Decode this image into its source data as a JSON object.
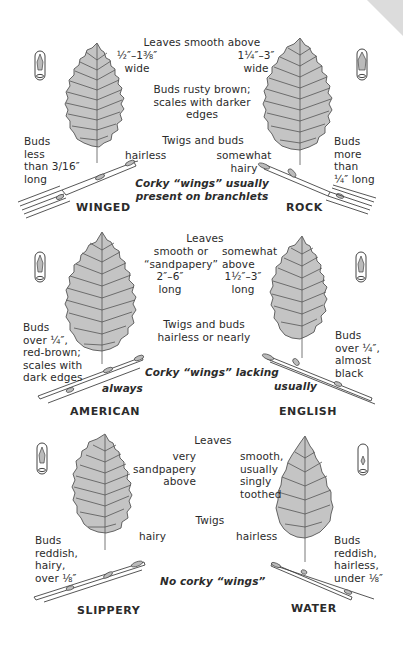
{
  "page": {
    "background": "#ffffff",
    "leaf_color": "#c4c4c4",
    "ink_color": "#2b2b2b"
  },
  "sections": [
    {
      "id": "winged-rock",
      "species": [
        {
          "name": "WINGED",
          "leaf_width": "½″–1⅜″\nwide",
          "buds": "Buds\nless\nthan 3/16″\nlong",
          "twig": "hairless"
        },
        {
          "name": "ROCK",
          "leaf_width": "1¼″–3″\nwide",
          "buds": "Buds\nmore\nthan\n¼″ long",
          "twig": "somewhat\nhairy"
        }
      ],
      "leaves_heading": "Leaves smooth above",
      "center_buds": "Buds rusty brown;\nscales with darker\nedges",
      "twigs_heading": "Twigs and buds",
      "corky": "Corky “wings” usually\npresent on branchlets"
    },
    {
      "id": "american-english",
      "species": [
        {
          "name": "AMERICAN",
          "leaf_surface": "smooth or\n“sandpapery”",
          "leaf_length": "2″–6″\nlong",
          "buds": "Buds\nover ¼″,\nred-brown;\nscales with\ndark edges",
          "corky_qualifier": "always"
        },
        {
          "name": "ENGLISH",
          "leaf_surface": "somewhat\nabove",
          "leaf_length": "1½″–3″\nlong",
          "buds": "Buds\nover ¼″,\nalmost\nblack",
          "corky_qualifier": "usually"
        }
      ],
      "leaves_heading": "Leaves",
      "twigs_heading": "Twigs and buds\nhairless or nearly",
      "corky": "Corky “wings” lacking"
    },
    {
      "id": "slippery-water",
      "species": [
        {
          "name": "SLIPPERY",
          "leaf_surface": "very\nsandpapery\nabove",
          "twig": "hairy",
          "buds": "Buds\nreddish,\nhairy,\nover ⅛″"
        },
        {
          "name": "WATER",
          "leaf_surface": "smooth,\nusually\nsingly\ntoothed",
          "twig": "hairless",
          "buds": "Buds\nreddish,\nhairless,\nunder ⅛″"
        }
      ],
      "leaves_heading": "Leaves",
      "twigs_heading": "Twigs",
      "corky": "No corky “wings”"
    }
  ],
  "icons": [
    "bud-closeup-icon",
    "leaf-illustration",
    "twig-illustration"
  ]
}
